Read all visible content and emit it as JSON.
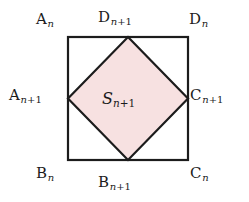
{
  "figure": {
    "type": "geometry-diagram",
    "background_color": "#ffffff",
    "stroke_color": "#1c1c1c",
    "inner_fill_color": "#f7e1e1",
    "outer_square": {
      "x": 68,
      "y": 37,
      "width": 120,
      "height": 123,
      "stroke_width": 2.2
    },
    "inner_diamond": {
      "points": "128,37 188,98.5 128,160 68,98.5",
      "stroke_width": 2.2
    },
    "labels": {
      "top_left": {
        "base": "A",
        "sub": "n"
      },
      "top_center": {
        "base": "D",
        "sub": "n",
        "sub_suffix": "+1"
      },
      "top_right": {
        "base": "D",
        "sub": "n"
      },
      "left_middle": {
        "base": "A",
        "sub": "n",
        "sub_suffix": "+1"
      },
      "right_middle": {
        "base": "C",
        "sub": "n",
        "sub_suffix": "+1"
      },
      "bottom_left": {
        "base": "B",
        "sub": "n"
      },
      "bottom_center": {
        "base": "B",
        "sub": "n",
        "sub_suffix": "+1"
      },
      "bottom_right": {
        "base": "C",
        "sub": "n"
      },
      "center_area": {
        "base": "S",
        "sub": "n",
        "sub_suffix": "+1"
      }
    }
  }
}
